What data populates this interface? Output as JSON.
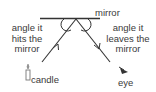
{
  "diagram": {
    "labels": {
      "mirror": "mirror",
      "incident_angle": [
        "angle it",
        "hits the",
        "mirror"
      ],
      "reflected_angle": [
        "angle it",
        "leaves the",
        "mirror"
      ],
      "source": "candle",
      "observer": "eye"
    },
    "icons": {
      "source": "candle-icon",
      "observer": "eye-icon"
    },
    "colors": {
      "lines": "#333333",
      "text": "#3a3a3a",
      "candle": "#888888",
      "background": "#ffffff"
    }
  }
}
